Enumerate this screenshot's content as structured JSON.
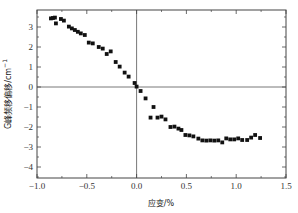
{
  "chart_data": {
    "type": "scatter",
    "title": "",
    "xlabel": "应变/%",
    "ylabel": "G峰频移偏移/cm",
    "ylabel_superscript": "−1",
    "xlim": [
      -1.0,
      1.5
    ],
    "ylim": [
      -4.55,
      3.85
    ],
    "x_ticks": [
      -1.0,
      -0.5,
      0.0,
      0.5,
      1.0,
      1.5
    ],
    "x_tick_labels": [
      "−1.0",
      "−0.5",
      "0.0",
      "0.5",
      "1.0",
      "1.5"
    ],
    "y_ticks": [
      -4,
      -3,
      -2,
      -1,
      0,
      1,
      2,
      3
    ],
    "y_tick_labels": [
      "−4",
      "−3",
      "−2",
      "−1",
      "0",
      "1",
      "2",
      "3"
    ],
    "grid": false,
    "reference_lines": {
      "x": 0,
      "y": 0
    },
    "marker": "square",
    "marker_color": "#111111",
    "series": [
      {
        "name": "G peak shift",
        "points": [
          [
            -0.86,
            3.43
          ],
          [
            -0.84,
            3.45
          ],
          [
            -0.82,
            3.47
          ],
          [
            -0.81,
            3.18
          ],
          [
            -0.76,
            3.4
          ],
          [
            -0.73,
            3.32
          ],
          [
            -0.68,
            3.02
          ],
          [
            -0.65,
            2.93
          ],
          [
            -0.62,
            2.85
          ],
          [
            -0.59,
            2.76
          ],
          [
            -0.56,
            2.68
          ],
          [
            -0.52,
            2.6
          ],
          [
            -0.48,
            2.22
          ],
          [
            -0.44,
            2.18
          ],
          [
            -0.38,
            2.0
          ],
          [
            -0.34,
            1.92
          ],
          [
            -0.3,
            1.65
          ],
          [
            -0.26,
            1.78
          ],
          [
            -0.21,
            1.25
          ],
          [
            -0.17,
            1.02
          ],
          [
            -0.12,
            0.72
          ],
          [
            -0.08,
            0.52
          ],
          [
            -0.02,
            0.2
          ],
          [
            0.0,
            0.02
          ],
          [
            0.04,
            -0.2
          ],
          [
            0.09,
            -0.57
          ],
          [
            0.17,
            -1.0
          ],
          [
            0.14,
            -1.53
          ],
          [
            0.21,
            -1.53
          ],
          [
            0.25,
            -1.48
          ],
          [
            0.29,
            -1.62
          ],
          [
            0.34,
            -2.0
          ],
          [
            0.38,
            -1.98
          ],
          [
            0.42,
            -2.08
          ],
          [
            0.45,
            -2.15
          ],
          [
            0.49,
            -2.4
          ],
          [
            0.53,
            -2.42
          ],
          [
            0.57,
            -2.47
          ],
          [
            0.62,
            -2.58
          ],
          [
            0.66,
            -2.67
          ],
          [
            0.7,
            -2.68
          ],
          [
            0.74,
            -2.67
          ],
          [
            0.78,
            -2.68
          ],
          [
            0.82,
            -2.67
          ],
          [
            0.86,
            -2.77
          ],
          [
            0.9,
            -2.57
          ],
          [
            0.94,
            -2.62
          ],
          [
            0.98,
            -2.62
          ],
          [
            1.02,
            -2.57
          ],
          [
            1.06,
            -2.65
          ],
          [
            1.11,
            -2.65
          ],
          [
            1.15,
            -2.53
          ],
          [
            1.19,
            -2.4
          ],
          [
            1.24,
            -2.55
          ]
        ]
      }
    ]
  }
}
